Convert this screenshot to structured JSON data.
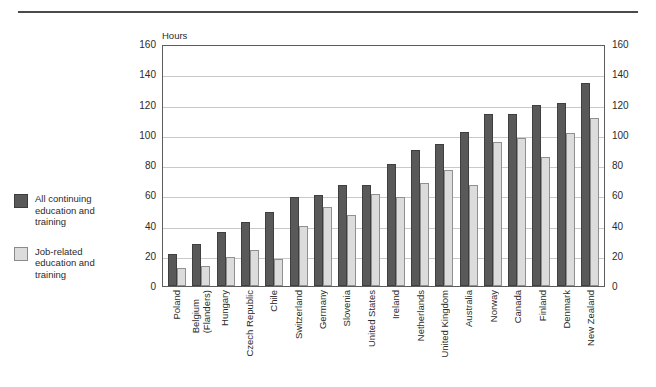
{
  "legend": {
    "items": [
      {
        "label": "All continuing\neducation and\ntraining",
        "swatch": "dark",
        "color": "#595959"
      },
      {
        "label": "Job-related\neducation and\ntraining",
        "swatch": "light",
        "color": "#dcdcdc"
      }
    ]
  },
  "axis": {
    "unit_label": "Hours",
    "left_ticks": [
      "160",
      "140",
      "120",
      "100",
      "80",
      "60",
      "40",
      "20",
      "0"
    ],
    "right_ticks": [
      "160",
      "140",
      "120",
      "100",
      "80",
      "60",
      "40",
      "20",
      "0"
    ]
  },
  "chart_data": {
    "type": "bar",
    "title": "",
    "xlabel": "",
    "ylabel": "Hours",
    "ylim": [
      0,
      160
    ],
    "ytick_step": 20,
    "grid": true,
    "legend_position": "left-outside",
    "categories": [
      "Poland",
      "Belgium\n(Flanders)",
      "Hungary",
      "Czech Republic",
      "Chile",
      "Switzerland",
      "Germany",
      "Slovenia",
      "United States",
      "Ireland",
      "Netherlands",
      "United Kingdom",
      "Australia",
      "Norway",
      "Canada",
      "Finland",
      "Denmark",
      "New Zealand"
    ],
    "series": [
      {
        "name": "All continuing education and training",
        "color": "#595959",
        "values": [
          21,
          28,
          36,
          42,
          49,
          59,
          60,
          67,
          67,
          81,
          90,
          94,
          102,
          114,
          114,
          120,
          121,
          134
        ]
      },
      {
        "name": "Job-related education and training",
        "color": "#dcdcdc",
        "values": [
          12,
          13,
          19,
          24,
          18,
          40,
          52,
          47,
          61,
          59,
          68,
          77,
          67,
          95,
          98,
          85,
          101,
          111
        ]
      }
    ]
  }
}
